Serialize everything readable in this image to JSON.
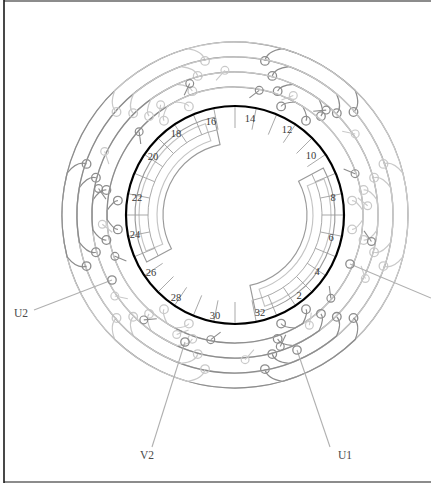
{
  "diagram": {
    "type": "motor-stator-winding",
    "frame": {
      "border_color": "#1a1a1a",
      "background": "#ffffff"
    },
    "stator": {
      "center": {
        "x": 235,
        "y": 215
      },
      "outline_radius": 109,
      "outline_color": "#000000",
      "outline_width": 2.2,
      "slot_count": 32,
      "slot_label_radius": 95,
      "slot_labels": [
        {
          "number": "2",
          "angle_deg": 22.5,
          "x": 299,
          "y": 297
        },
        {
          "number": "4",
          "angle_deg": 45.0,
          "x": 317,
          "y": 273
        },
        {
          "number": "6",
          "angle_deg": 67.5,
          "x": 331,
          "y": 239
        },
        {
          "number": "8",
          "angle_deg": 90.0,
          "x": 333,
          "y": 199
        },
        {
          "number": "10",
          "angle_deg": 112.5,
          "x": 311,
          "y": 157
        },
        {
          "number": "12",
          "angle_deg": 135.0,
          "x": 287,
          "y": 131
        },
        {
          "number": "14",
          "angle_deg": 157.5,
          "x": 250,
          "y": 120
        },
        {
          "number": "16",
          "angle_deg": 180.0,
          "x": 211,
          "y": 123
        },
        {
          "number": "18",
          "angle_deg": 202.5,
          "x": 176,
          "y": 135
        },
        {
          "number": "20",
          "angle_deg": 225.0,
          "x": 153,
          "y": 158
        },
        {
          "number": "22",
          "angle_deg": 247.5,
          "x": 137,
          "y": 199
        },
        {
          "number": "24",
          "angle_deg": 270.0,
          "x": 135,
          "y": 236
        },
        {
          "number": "26",
          "angle_deg": 292.5,
          "x": 151,
          "y": 274
        },
        {
          "number": "28",
          "angle_deg": 315.0,
          "x": 176,
          "y": 299
        },
        {
          "number": "30",
          "angle_deg": 337.5,
          "x": 215,
          "y": 317
        },
        {
          "number": "32",
          "angle_deg": 0.0,
          "x": 260,
          "y": 314
        }
      ]
    },
    "terminals": [
      {
        "name": "U1",
        "label": "U1",
        "x": 338,
        "y": 457,
        "leader_from": {
          "x": 330,
          "y": 447
        },
        "leader_to": {
          "x": 297,
          "y": 350
        }
      },
      {
        "name": "V2",
        "label": "V2",
        "x": 140,
        "y": 457,
        "leader_from": {
          "x": 152,
          "y": 447
        },
        "leader_to": {
          "x": 185,
          "y": 342
        }
      },
      {
        "name": "U2",
        "label": "U2",
        "x": 14,
        "y": 315,
        "leader_from": {
          "x": 34,
          "y": 310
        },
        "leader_to": {
          "x": 112,
          "y": 280
        }
      },
      {
        "name": "unlabeled-right",
        "label": "",
        "x": 431,
        "y": 298,
        "leader_from": {
          "x": 431,
          "y": 298
        },
        "leader_to": {
          "x": 350,
          "y": 264
        }
      }
    ],
    "winding_groups": [
      {
        "name": "phase-group-1",
        "color": "#8c8c8c",
        "base_angle_deg": 0
      },
      {
        "name": "phase-group-2",
        "color": "#c9c9c9",
        "base_angle_deg": 60
      },
      {
        "name": "phase-group-3",
        "color": "#8c8c8c",
        "base_angle_deg": 120
      },
      {
        "name": "phase-group-4",
        "color": "#c9c9c9",
        "base_angle_deg": 180
      },
      {
        "name": "phase-group-5",
        "color": "#8c8c8c",
        "base_angle_deg": 240
      },
      {
        "name": "phase-group-6",
        "color": "#c9c9c9",
        "base_angle_deg": 300
      }
    ],
    "colors": {
      "dark_winding": "#8c8c8c",
      "light_winding": "#c9c9c9",
      "inner_band": "#9a9a9a",
      "slot_divider": "#9a9a9a",
      "leader_line": "#b0b0b0",
      "text": "#3a3a3a"
    }
  }
}
